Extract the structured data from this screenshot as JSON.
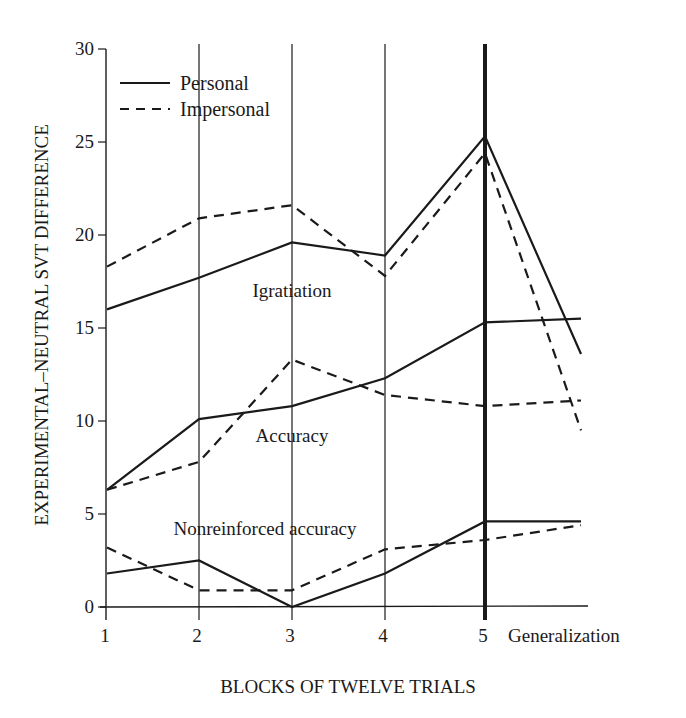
{
  "chart_data": {
    "type": "line",
    "title": "",
    "xlabel": "BLOCKS OF TWELVE TRIALS",
    "ylabel": "EXPERIMENTAL–NEUTRAL SVT DIFFERENCE",
    "categories": [
      "1",
      "2",
      "3",
      "4",
      "5",
      "Generalization"
    ],
    "ylim": [
      0,
      30
    ],
    "yticks": [
      0,
      5,
      10,
      15,
      20,
      25,
      30
    ],
    "grid": "vertical lines at blocks 1–5; heavy line at block 5",
    "legend": {
      "position": "upper-left",
      "entries": [
        {
          "label": "Personal",
          "style": "solid"
        },
        {
          "label": "Impersonal",
          "style": "dashed"
        }
      ]
    },
    "annotations": [
      {
        "text": "Igratiation",
        "x": 3,
        "y": 17.0
      },
      {
        "text": "Accuracy",
        "x": 3,
        "y": 9.2
      },
      {
        "text": "Nonreinforced accuracy",
        "x": 2.4,
        "y": 4.2
      }
    ],
    "series": [
      {
        "name": "Igratiation – Personal",
        "group": "Igratiation",
        "style": "solid",
        "values": [
          16.0,
          17.7,
          19.6,
          18.9,
          25.3,
          13.6
        ]
      },
      {
        "name": "Igratiation – Impersonal",
        "group": "Igratiation",
        "style": "dashed",
        "values": [
          18.3,
          20.9,
          21.6,
          17.8,
          24.4,
          9.5
        ]
      },
      {
        "name": "Accuracy – Personal",
        "group": "Accuracy",
        "style": "solid",
        "values": [
          6.3,
          10.1,
          10.8,
          12.3,
          15.3,
          15.5
        ]
      },
      {
        "name": "Accuracy – Impersonal",
        "group": "Accuracy",
        "style": "dashed",
        "values": [
          6.3,
          7.8,
          13.3,
          11.4,
          10.8,
          11.1
        ]
      },
      {
        "name": "Nonreinforced accuracy – Personal",
        "group": "Nonreinforced accuracy",
        "style": "solid",
        "values": [
          1.8,
          2.5,
          0.0,
          1.8,
          4.6,
          4.6
        ]
      },
      {
        "name": "Nonreinforced accuracy – Impersonal",
        "group": "Nonreinforced accuracy",
        "style": "dashed",
        "values": [
          3.2,
          0.9,
          0.9,
          3.1,
          3.6,
          4.4
        ]
      }
    ]
  }
}
